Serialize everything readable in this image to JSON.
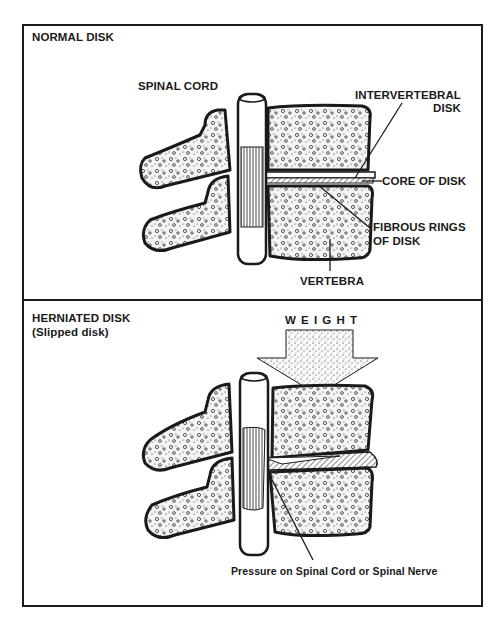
{
  "panels": [
    {
      "title": "NORMAL DISK",
      "labels": {
        "spinal_cord": "SPINAL CORD",
        "intervertebral_disk_line1": "INTERVERTEBRAL",
        "intervertebral_disk_line2": "DISK",
        "core_of_disk": "CORE OF DISK",
        "fibrous_rings_line1": "FIBROUS RINGS",
        "fibrous_rings_line2": "OF DISK",
        "vertebra": "VERTEBRA"
      }
    },
    {
      "title": "HERNIATED DISK",
      "subtitle": "(Slipped disk)",
      "labels": {
        "weight": "W E I G H T",
        "pressure": "Pressure on Spinal Cord or Spinal Nerve"
      }
    }
  ],
  "colors": {
    "ink": "#1a1a1a",
    "paper": "#ffffff",
    "bone_fill": "#f4f4f4"
  }
}
